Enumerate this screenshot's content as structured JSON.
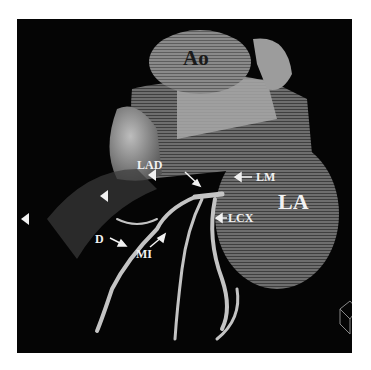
{
  "figure": {
    "labels": {
      "aorta": "Ao",
      "left_atrium": "LA",
      "lad": "LAD",
      "left_main": "LM",
      "lcx": "LCX",
      "diagonal": "D",
      "intermediate": "MI"
    },
    "colors": {
      "background": "#050505",
      "tissue_light": "#b9b9b9",
      "tissue_mid": "#7a7a7a",
      "tissue_dark": "#4a4a4a",
      "label": "#f2f2f2"
    }
  }
}
